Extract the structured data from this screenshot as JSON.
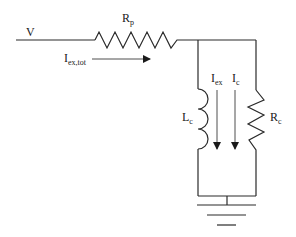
{
  "diagram": {
    "type": "circuit",
    "labels": {
      "voltage": "V",
      "series_resistor": {
        "main": "R",
        "sub": "p"
      },
      "total_current": {
        "main": "I",
        "sub": "ex,tot"
      },
      "inductor": {
        "main": "L",
        "sub": "c"
      },
      "shunt_resistor": {
        "main": "R",
        "sub": "c"
      },
      "excitation_current": {
        "main": "I",
        "sub": "ex"
      },
      "core_current": {
        "main": "I",
        "sub": "c"
      }
    },
    "components": [
      {
        "id": "Rp",
        "kind": "resistor",
        "orientation": "horizontal"
      },
      {
        "id": "Lc",
        "kind": "inductor",
        "orientation": "vertical"
      },
      {
        "id": "Rc",
        "kind": "resistor",
        "orientation": "vertical"
      },
      {
        "id": "GND",
        "kind": "ground"
      }
    ],
    "colors": {
      "stroke": "#2a2a2a",
      "background": "#ffffff"
    }
  }
}
